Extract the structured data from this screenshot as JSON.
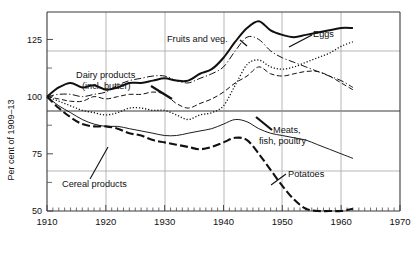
{
  "chart_data": {
    "type": "line",
    "title": "",
    "xlabel": "",
    "ylabel": "Per cent of 1909–13",
    "xlim": [
      1910,
      1970
    ],
    "ylim": [
      50,
      137
    ],
    "grid": true,
    "legend_position": "inline-annotations",
    "x_ticks": [
      1910,
      1920,
      1930,
      1940,
      1950,
      1960,
      1970
    ],
    "x_tick_labels": [
      "1910",
      "1920",
      "1930",
      "1940",
      "1950",
      "1960",
      "1970"
    ],
    "x_minor_tick_step": 1,
    "y_ticks": [
      50,
      75,
      100,
      125
    ],
    "y_tick_labels": [
      "50",
      "75",
      "100",
      "125"
    ],
    "y_minor_ticks": [
      62.5,
      87.5,
      112.5,
      137.5
    ],
    "series": [
      {
        "name": "Fruits and veg.",
        "label": "Fruits and veg.",
        "style": "solid-thick",
        "x": [
          1910,
          1912,
          1914,
          1916,
          1918,
          1920,
          1922,
          1924,
          1926,
          1928,
          1930,
          1932,
          1934,
          1936,
          1938,
          1940,
          1942,
          1944,
          1946,
          1948,
          1950,
          1952,
          1954,
          1956,
          1958,
          1960,
          1962
        ],
        "values": [
          100,
          104,
          106,
          104,
          105,
          103,
          104,
          106,
          106,
          107,
          108,
          107,
          107,
          110,
          112,
          117,
          124,
          130,
          133,
          129,
          127,
          126,
          127,
          128,
          129,
          130,
          130
        ]
      },
      {
        "name": "Dairy products (incl. butter)",
        "label": "Dairy products\n(incl. butter)",
        "style": "dash-dot",
        "x": [
          1910,
          1912,
          1914,
          1916,
          1918,
          1920,
          1922,
          1924,
          1926,
          1928,
          1930,
          1932,
          1934,
          1936,
          1938,
          1940,
          1942,
          1944,
          1946,
          1948,
          1950,
          1952,
          1954,
          1956,
          1958,
          1960,
          1962
        ],
        "values": [
          100,
          101,
          101,
          100,
          101,
          102,
          105,
          107,
          108,
          109,
          109,
          107,
          106,
          108,
          110,
          113,
          120,
          126,
          125,
          120,
          117,
          115,
          113,
          111,
          109,
          107,
          104
        ]
      },
      {
        "name": "Eggs",
        "label": "Eggs",
        "style": "dotted",
        "x": [
          1910,
          1912,
          1914,
          1916,
          1918,
          1920,
          1922,
          1924,
          1926,
          1928,
          1930,
          1932,
          1934,
          1936,
          1938,
          1940,
          1942,
          1944,
          1946,
          1948,
          1950,
          1952,
          1954,
          1956,
          1958,
          1960,
          1962
        ],
        "values": [
          100,
          98,
          96,
          94,
          93,
          92,
          93,
          95,
          95,
          94,
          94,
          92,
          90,
          92,
          93,
          96,
          105,
          114,
          116,
          113,
          112,
          113,
          115,
          117,
          119,
          122,
          124
        ]
      },
      {
        "name": "Meats, fish, poultry",
        "label": "Meats,\nfish, poultry",
        "style": "dashed",
        "x": [
          1910,
          1912,
          1914,
          1916,
          1918,
          1920,
          1922,
          1924,
          1926,
          1928,
          1930,
          1932,
          1934,
          1936,
          1938,
          1940,
          1942,
          1944,
          1946,
          1948,
          1950,
          1952,
          1954,
          1956,
          1958,
          1960,
          1962
        ],
        "values": [
          100,
          99,
          98,
          98,
          100,
          99,
          100,
          101,
          101,
          102,
          101,
          97,
          95,
          97,
          99,
          102,
          106,
          109,
          113,
          110,
          109,
          110,
          111,
          111,
          109,
          106,
          103
        ]
      },
      {
        "name": "Cereal products",
        "label": "Cereal products",
        "style": "thin",
        "x": [
          1910,
          1912,
          1914,
          1916,
          1918,
          1920,
          1922,
          1924,
          1926,
          1928,
          1930,
          1932,
          1934,
          1936,
          1938,
          1940,
          1942,
          1944,
          1946,
          1948,
          1950,
          1952,
          1954,
          1956,
          1958,
          1960,
          1962
        ],
        "values": [
          100,
          96,
          93,
          90,
          88,
          87,
          87,
          86,
          85,
          84,
          83,
          83,
          84,
          85,
          86,
          88,
          90,
          89,
          86,
          84,
          83,
          82,
          81,
          79,
          77,
          75,
          73
        ]
      },
      {
        "name": "Potatoes",
        "label": "Potatoes",
        "style": "heavy-dash",
        "x": [
          1910,
          1912,
          1914,
          1916,
          1918,
          1920,
          1922,
          1924,
          1926,
          1928,
          1930,
          1932,
          1934,
          1936,
          1938,
          1940,
          1942,
          1944,
          1946,
          1948,
          1950,
          1952,
          1954,
          1956,
          1958,
          1960,
          1962
        ],
        "values": [
          100,
          95,
          91,
          88,
          87,
          87,
          86,
          84,
          83,
          81,
          80,
          79,
          78,
          77,
          78,
          80,
          82,
          81,
          75,
          68,
          61,
          55,
          51,
          50,
          50,
          50,
          51
        ]
      }
    ],
    "annotations": [
      {
        "text": "Fruits and veg.",
        "name": "fruits-and-veg-label"
      },
      {
        "text": "Dairy products",
        "name": "dairy-products-label-line1"
      },
      {
        "text": "(incl. butter)",
        "name": "dairy-products-label-line2"
      },
      {
        "text": "Eggs",
        "name": "eggs-label"
      },
      {
        "text": "Meats,",
        "name": "meats-label-line1"
      },
      {
        "text": "fish, poultry",
        "name": "meats-label-line2"
      },
      {
        "text": "Cereal products",
        "name": "cereal-products-label"
      },
      {
        "text": "Potatoes",
        "name": "potatoes-label"
      }
    ]
  }
}
